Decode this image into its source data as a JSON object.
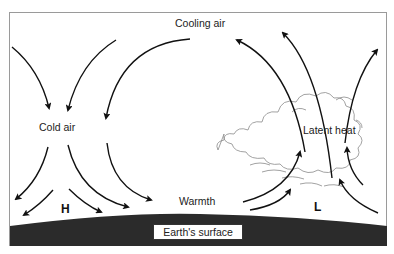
{
  "diagram": {
    "labels": {
      "cooling_air": "Cooling air",
      "cold_air": "Cold air",
      "high_pressure": "H",
      "warmth": "Warmth",
      "low_pressure": "L",
      "latent_heat": "Latent heat",
      "earths_surface": "Earth's surface"
    },
    "colors": {
      "ground": "#2b2b2b",
      "arrow": "#111111",
      "cloud_outline": "#8a8a8a",
      "frame": "#9a9a9a",
      "background": "#ffffff"
    }
  }
}
